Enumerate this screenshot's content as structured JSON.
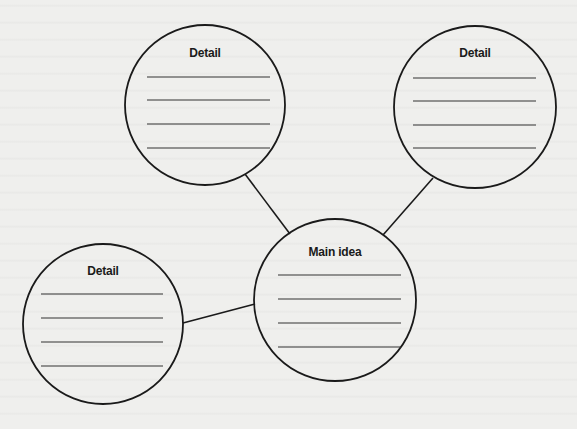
{
  "diagram": {
    "type": "concept-web",
    "colors": {
      "background": "#efefed",
      "stroke": "#1a1a1a",
      "fill": "#ffffff",
      "rule": "#333333"
    },
    "nodes": [
      {
        "id": "detail-top-left",
        "label": "Detail",
        "cx": 205,
        "cy": 105,
        "r": 80,
        "label_y": 57,
        "lines": [
          77,
          100,
          124,
          148
        ],
        "line_x1": 147,
        "line_x2": 270
      },
      {
        "id": "detail-top-right",
        "label": "Detail",
        "cx": 475,
        "cy": 107,
        "r": 81,
        "label_y": 57,
        "lines": [
          78,
          101,
          125,
          148
        ],
        "line_x1": 413,
        "line_x2": 536
      },
      {
        "id": "detail-bottom-left",
        "label": "Detail",
        "cx": 103,
        "cy": 324,
        "r": 80,
        "label_y": 275,
        "lines": [
          294,
          318,
          342,
          366
        ],
        "line_x1": 41,
        "line_x2": 163
      },
      {
        "id": "main-idea",
        "label": "Main idea",
        "cx": 335,
        "cy": 300,
        "r": 81,
        "label_y": 256,
        "lines": [
          275,
          299,
          323,
          347
        ],
        "line_x1": 278,
        "line_x2": 401
      }
    ],
    "connectors": [
      {
        "from": "detail-top-left",
        "to": "main-idea",
        "x1": 245,
        "y1": 174,
        "x2": 290,
        "y2": 234
      },
      {
        "from": "detail-top-right",
        "to": "main-idea",
        "x1": 433,
        "y1": 178,
        "x2": 383,
        "y2": 235
      },
      {
        "from": "detail-bottom-left",
        "to": "main-idea",
        "x1": 183,
        "y1": 323,
        "x2": 255,
        "y2": 304
      }
    ]
  }
}
